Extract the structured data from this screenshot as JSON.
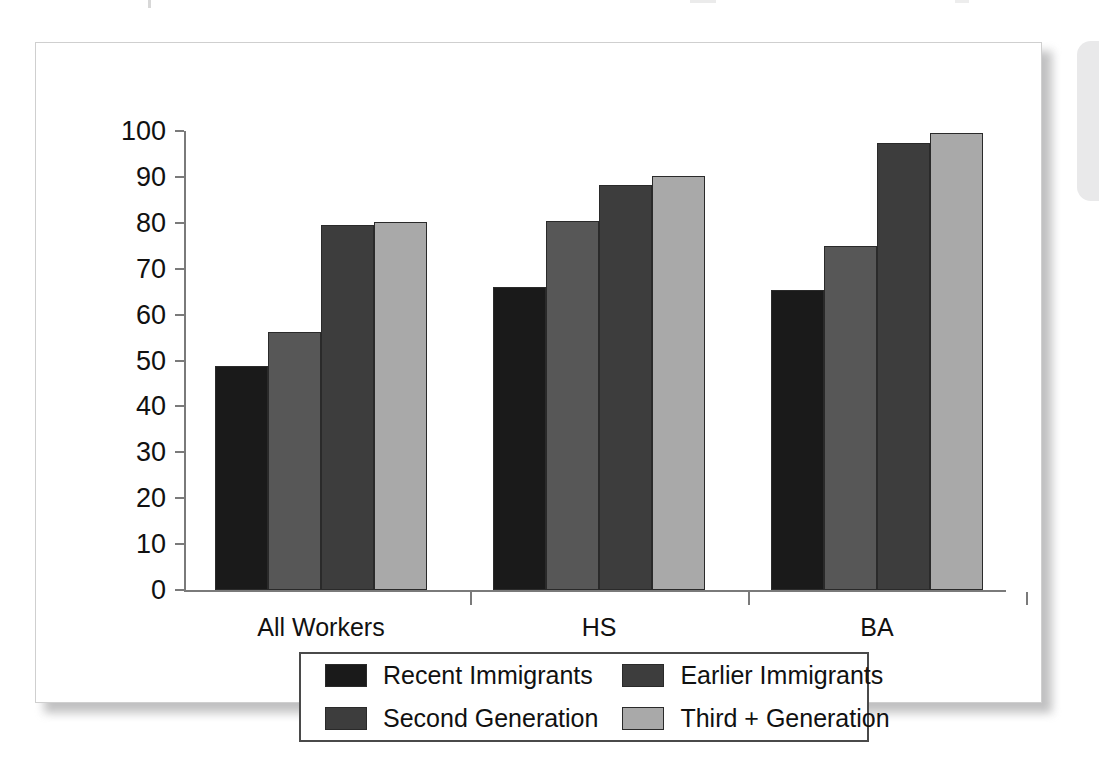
{
  "chart_data": {
    "type": "bar",
    "title": "",
    "subtitle": "",
    "xlabel": "",
    "ylabel": "",
    "ylim": [
      0,
      100
    ],
    "ytick_values": [
      0,
      10,
      20,
      30,
      40,
      50,
      60,
      70,
      80,
      90,
      100
    ],
    "ytick_labels": [
      "0",
      "10",
      "20",
      "30",
      "40",
      "50",
      "60",
      "70",
      "80",
      "90",
      "100"
    ],
    "grid": false,
    "legend_position": "bottom",
    "categories": [
      "All Workers",
      "HS",
      "BA"
    ],
    "series": [
      {
        "name": "Recent Immigrants",
        "color": "#1a1a1a",
        "values": [
          48.8,
          66.1,
          65.3
        ]
      },
      {
        "name": "Earlier Immigrants",
        "color": "#575757",
        "values": [
          56.2,
          80.5,
          74.9
        ]
      },
      {
        "name": "Second Generation",
        "color": "#3d3d3d",
        "values": [
          79.5,
          88.3,
          97.3
        ]
      },
      {
        "name": "Third + Generation",
        "color": "#a9a9a9",
        "values": [
          80.1,
          90.2,
          99.5
        ]
      }
    ],
    "legend_entries": [
      {
        "label": "Recent Immigrants",
        "color": "#1a1a1a"
      },
      {
        "label": "Earlier Immigrants",
        "color": "#3d3d3d"
      },
      {
        "label": "Second Generation",
        "color": "#3d3d3d"
      },
      {
        "label": "Third + Generation",
        "color": "#a9a9a9"
      }
    ]
  },
  "figure": {
    "background_color": "#ffffff",
    "axis_color": "#7a7a7a",
    "border_color": "#cfcfcf",
    "text_color": "#111111"
  }
}
